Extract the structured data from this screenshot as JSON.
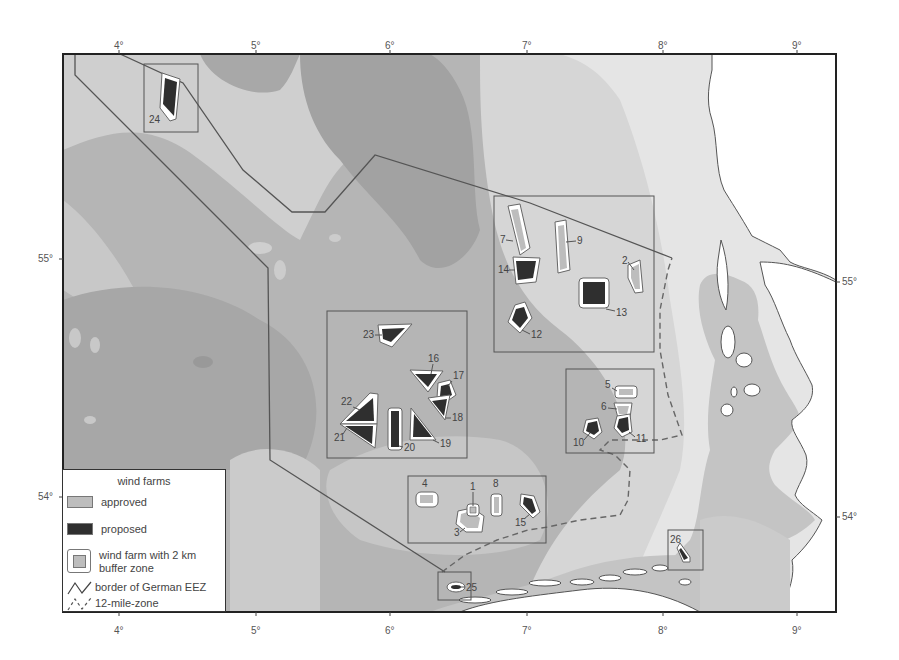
{
  "map": {
    "lon_ticks": [
      {
        "label": "4°",
        "x": 119
      },
      {
        "label": "5°",
        "x": 256
      },
      {
        "label": "6°",
        "x": 390
      },
      {
        "label": "7°",
        "x": 527
      },
      {
        "label": "8°",
        "x": 663
      },
      {
        "label": "9°",
        "x": 797
      }
    ],
    "lat_ticks": [
      {
        "label": "55°",
        "y": 259
      },
      {
        "label": "54°",
        "y": 497
      }
    ],
    "colors": {
      "deep_water": "#a3a3a3",
      "mid_water": "#b7b7b7",
      "shallow_water": "#d2d2d2",
      "coastal_water": "#e6e6e6",
      "land": "#ffffff",
      "tidal_flat": "#c4c4c4",
      "approved": "#bdbdbd",
      "proposed": "#2f2f2f",
      "border": "#555555"
    },
    "wind_farms": [
      {
        "id": "1",
        "status": "approved"
      },
      {
        "id": "2",
        "status": "approved"
      },
      {
        "id": "3",
        "status": "approved"
      },
      {
        "id": "4",
        "status": "approved"
      },
      {
        "id": "5",
        "status": "approved"
      },
      {
        "id": "6",
        "status": "approved"
      },
      {
        "id": "7",
        "status": "approved"
      },
      {
        "id": "8",
        "status": "approved"
      },
      {
        "id": "9",
        "status": "approved"
      },
      {
        "id": "10",
        "status": "proposed"
      },
      {
        "id": "11",
        "status": "proposed"
      },
      {
        "id": "12",
        "status": "proposed"
      },
      {
        "id": "13",
        "status": "proposed"
      },
      {
        "id": "14",
        "status": "proposed"
      },
      {
        "id": "15",
        "status": "proposed"
      },
      {
        "id": "16",
        "status": "proposed"
      },
      {
        "id": "17",
        "status": "proposed"
      },
      {
        "id": "18",
        "status": "proposed"
      },
      {
        "id": "19",
        "status": "proposed"
      },
      {
        "id": "20",
        "status": "proposed"
      },
      {
        "id": "21",
        "status": "proposed"
      },
      {
        "id": "22",
        "status": "proposed"
      },
      {
        "id": "23",
        "status": "proposed"
      },
      {
        "id": "24",
        "status": "proposed"
      },
      {
        "id": "25",
        "status": "proposed"
      },
      {
        "id": "26",
        "status": "proposed"
      }
    ]
  },
  "legend": {
    "title": "wind farms",
    "items": [
      {
        "label": "approved"
      },
      {
        "label": "proposed"
      },
      {
        "label": "wind farm with 2 km buffer zone"
      },
      {
        "label": "border of German EEZ"
      },
      {
        "label": "12-mile-zone"
      }
    ]
  }
}
